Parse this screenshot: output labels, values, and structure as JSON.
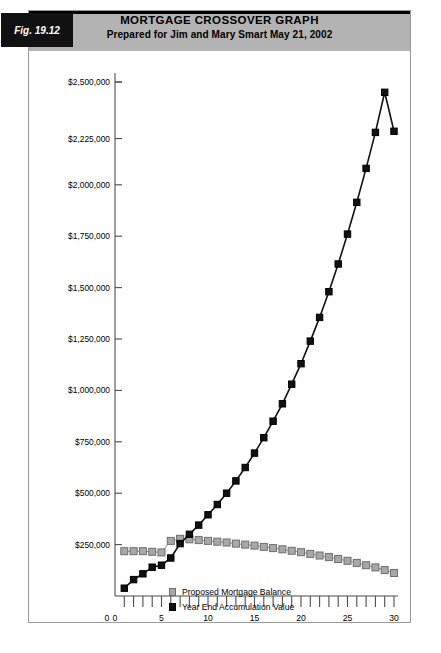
{
  "figure": {
    "tag_label": "Fig. 19.12",
    "title": "MORTGAGE CROSSOVER GRAPH",
    "subtitle": "Prepared for Jim and Mary Smart   May 21, 2002",
    "header_color": "#b3b3b3",
    "tag_background": "#111111",
    "border_color": "#9a9a9a"
  },
  "legend": {
    "position": "bottom-center",
    "items": [
      {
        "label": "Proposed Mortgage Balance",
        "swatch": "gray-square-marker",
        "color": "#a8a8a8"
      },
      {
        "label": "Year End Accumulation Value",
        "swatch": "black-square-marker",
        "color": "#111111"
      }
    ]
  },
  "chart_data": {
    "type": "line",
    "title": "MORTGAGE CROSSOVER GRAPH",
    "subtitle": "Prepared for Jim and Mary Smart   May 21, 2002",
    "xlabel": "",
    "ylabel": "",
    "grid": false,
    "legend_position": "bottom-center",
    "xlim": [
      0,
      30
    ],
    "ylim": [
      0,
      2500000
    ],
    "x": [
      1,
      2,
      3,
      4,
      5,
      6,
      7,
      8,
      9,
      10,
      11,
      12,
      13,
      14,
      15,
      16,
      17,
      18,
      19,
      20,
      21,
      22,
      23,
      24,
      25,
      26,
      27,
      28,
      29,
      30
    ],
    "x_ticks": [
      0,
      1,
      2,
      3,
      4,
      5,
      6,
      7,
      8,
      9,
      10,
      11,
      12,
      13,
      14,
      15,
      16,
      17,
      18,
      19,
      20,
      21,
      22,
      23,
      24,
      25,
      26,
      27,
      28,
      29,
      30
    ],
    "x_tick_labels": [
      "0",
      "5",
      "10",
      "15",
      "20",
      "25",
      "30"
    ],
    "x_labeled_values": [
      0,
      5,
      10,
      15,
      20,
      25,
      30
    ],
    "y_ticks": [
      250000,
      500000,
      750000,
      1000000,
      1250000,
      1500000,
      1750000,
      2000000,
      2225000,
      2500000
    ],
    "y_tick_labels": [
      "$250,000",
      "$500,000",
      "$750,000",
      "$1,000,000",
      "$1,250,000",
      "$1,500,000",
      "$1,750,000",
      "$2,000,000",
      "$2,225,000",
      "$2,500,000"
    ],
    "crossover_year": 6,
    "series": [
      {
        "name": "Proposed Mortgage Balance",
        "color": "#a8a8a8",
        "marker": "square",
        "values": [
          218000,
          218000,
          218000,
          215000,
          212000,
          268000,
          278000,
          276000,
          272000,
          268000,
          264000,
          260000,
          255000,
          250000,
          245000,
          239000,
          233000,
          227000,
          220000,
          213000,
          205000,
          197000,
          189000,
          180000,
          171000,
          161000,
          150000,
          139000,
          126000,
          112000
        ]
      },
      {
        "name": "Year End Accumulation Value",
        "color": "#111111",
        "marker": "square",
        "values": [
          38000,
          80000,
          108000,
          140000,
          150000,
          185000,
          255000,
          300000,
          345000,
          395000,
          445000,
          500000,
          560000,
          625000,
          695000,
          770000,
          850000,
          935000,
          1030000,
          1130000,
          1240000,
          1355000,
          1480000,
          1615000,
          1760000,
          1915000,
          2080000,
          2255000,
          2450000,
          2260000
        ]
      }
    ]
  }
}
